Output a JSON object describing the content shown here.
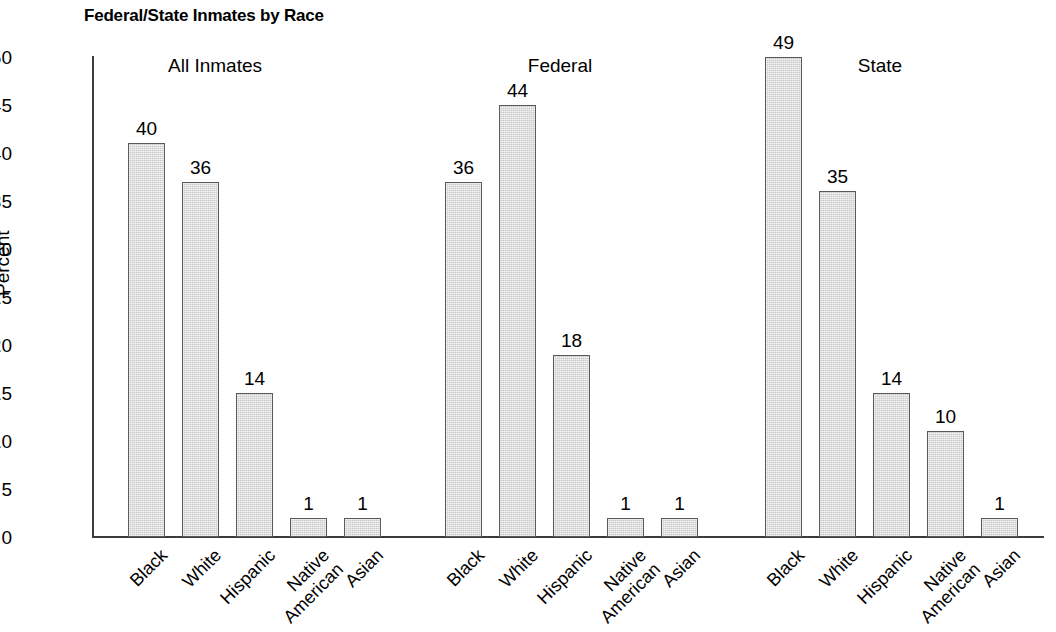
{
  "chart_data": {
    "type": "bar",
    "title": "Federal/State Inmates by Race",
    "xlabel": "",
    "ylabel": "Percent",
    "ylim": [
      0,
      50
    ],
    "yticks": [
      0,
      5,
      10,
      15,
      20,
      25,
      30,
      35,
      40,
      45,
      50
    ],
    "grid": false,
    "legend": "none",
    "categories": [
      "Black",
      "White",
      "Hispanic",
      "Native American",
      "Asian"
    ],
    "groups": [
      "All Inmates",
      "Federal",
      "State"
    ],
    "series": [
      {
        "name": "All Inmates",
        "values": [
          40,
          36,
          14,
          1,
          1
        ]
      },
      {
        "name": "Federal",
        "values": [
          36,
          44,
          18,
          1,
          1
        ]
      },
      {
        "name": "State",
        "values": [
          49,
          35,
          14,
          10,
          1
        ]
      }
    ],
    "bar_color": "#c8c8c8",
    "bar_border_color": "#5a5a5a",
    "axis_color": "#3c3c3c"
  },
  "axis": {
    "y_ticks": [
      {
        "label": "50",
        "value": 50
      },
      {
        "label": "45",
        "value": 45
      },
      {
        "label": "40",
        "value": 40
      },
      {
        "label": "35",
        "value": 35
      },
      {
        "label": "30",
        "value": 30
      },
      {
        "label": "25",
        "value": 25
      },
      {
        "label": "20",
        "value": 20
      },
      {
        "label": "15",
        "value": 15
      },
      {
        "label": "10",
        "value": 10
      },
      {
        "label": "5",
        "value": 5
      },
      {
        "label": "0",
        "value": 0
      }
    ],
    "y_title": "Percent"
  },
  "groups": [
    {
      "header": "All Inmates",
      "bars": [
        {
          "category": "Black",
          "cat_line1": "Black",
          "cat_line2": "",
          "value": 40,
          "label": "40",
          "draw_value": 41
        },
        {
          "category": "White",
          "cat_line1": "White",
          "cat_line2": "",
          "value": 36,
          "label": "36",
          "draw_value": 37
        },
        {
          "category": "Hispanic",
          "cat_line1": "Hispanic",
          "cat_line2": "",
          "value": 14,
          "label": "14",
          "draw_value": 15
        },
        {
          "category": "Native American",
          "cat_line1": "Native",
          "cat_line2": "American",
          "value": 1,
          "label": "1",
          "draw_value": 2
        },
        {
          "category": "Asian",
          "cat_line1": "Asian",
          "cat_line2": "",
          "value": 1,
          "label": "1",
          "draw_value": 2
        }
      ]
    },
    {
      "header": "Federal",
      "bars": [
        {
          "category": "Black",
          "cat_line1": "Black",
          "cat_line2": "",
          "value": 36,
          "label": "36",
          "draw_value": 37
        },
        {
          "category": "White",
          "cat_line1": "White",
          "cat_line2": "",
          "value": 44,
          "label": "44",
          "draw_value": 45
        },
        {
          "category": "Hispanic",
          "cat_line1": "Hispanic",
          "cat_line2": "",
          "value": 18,
          "label": "18",
          "draw_value": 19
        },
        {
          "category": "Native American",
          "cat_line1": "Native",
          "cat_line2": "American",
          "value": 1,
          "label": "1",
          "draw_value": 2
        },
        {
          "category": "Asian",
          "cat_line1": "Asian",
          "cat_line2": "",
          "value": 1,
          "label": "1",
          "draw_value": 2
        }
      ]
    },
    {
      "header": "State",
      "bars": [
        {
          "category": "Black",
          "cat_line1": "Black",
          "cat_line2": "",
          "value": 49,
          "label": "49",
          "draw_value": 50
        },
        {
          "category": "White",
          "cat_line1": "White",
          "cat_line2": "",
          "value": 35,
          "label": "35",
          "draw_value": 36
        },
        {
          "category": "Hispanic",
          "cat_line1": "Hispanic",
          "cat_line2": "",
          "value": 14,
          "label": "14",
          "draw_value": 15
        },
        {
          "category": "Native American",
          "cat_line1": "Native",
          "cat_line2": "American",
          "value": 10,
          "label": "10",
          "draw_value": 11
        },
        {
          "category": "Asian",
          "cat_line1": "Asian",
          "cat_line2": "",
          "value": 1,
          "label": "1",
          "draw_value": 2
        }
      ]
    }
  ],
  "layout": {
    "group_header_x": [
      215,
      560,
      880
    ],
    "group_start_x": [
      128,
      445,
      765
    ],
    "bar_width": 37,
    "bar_pitch": 54
  }
}
